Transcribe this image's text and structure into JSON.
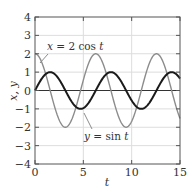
{
  "chart_data": {
    "type": "line",
    "title": "",
    "xlabel": "t",
    "ylabel": "x, y",
    "xlim": [
      0,
      15
    ],
    "ylim": [
      -4,
      4
    ],
    "xticks": [
      0,
      5,
      10,
      15
    ],
    "xtick_labels": [
      "0",
      "5",
      "10",
      "15"
    ],
    "yticks": [
      4,
      3,
      2,
      1,
      0,
      -1,
      -2,
      -3,
      -4
    ],
    "ytick_labels": [
      "4",
      "3",
      "2",
      "1",
      "0",
      "−1",
      "−2",
      "−3",
      "−4"
    ],
    "grid": true,
    "legend": null,
    "series": [
      {
        "name": "x = 2 cos t",
        "function": "2*cos(t)",
        "amplitude": 2,
        "kind": "cos",
        "color": "#8c8c8c",
        "linewidth": 1.4,
        "x": [
          0,
          1,
          2,
          3,
          4,
          5,
          6,
          7,
          8,
          9,
          10,
          11,
          12,
          13,
          14,
          15
        ],
        "values": [
          2.0,
          1.08,
          -0.83,
          -1.98,
          -1.31,
          0.57,
          1.92,
          1.51,
          -0.29,
          -1.82,
          -1.68,
          0.0,
          1.69,
          1.81,
          0.27,
          -1.52
        ]
      },
      {
        "name": "y = sin t",
        "function": "sin(t)",
        "amplitude": 1,
        "kind": "sin",
        "color": "#1a1a1a",
        "linewidth": 2.0,
        "x": [
          0,
          1,
          2,
          3,
          4,
          5,
          6,
          7,
          8,
          9,
          10,
          11,
          12,
          13,
          14,
          15
        ],
        "values": [
          0.0,
          0.84,
          0.91,
          0.14,
          -0.76,
          -0.96,
          -0.28,
          0.66,
          0.99,
          0.41,
          -0.54,
          -1.0,
          -0.54,
          0.42,
          0.99,
          0.65
        ]
      }
    ],
    "annotations": [
      {
        "prefix": "x",
        "text": " = 2 cos ",
        "suffix": "t",
        "series": 0
      },
      {
        "prefix": "y",
        "text": " = sin ",
        "suffix": "t",
        "series": 1
      }
    ]
  },
  "colors": {
    "axis": "#555555",
    "grid": "#dddddd",
    "zero_line": "#333333"
  }
}
